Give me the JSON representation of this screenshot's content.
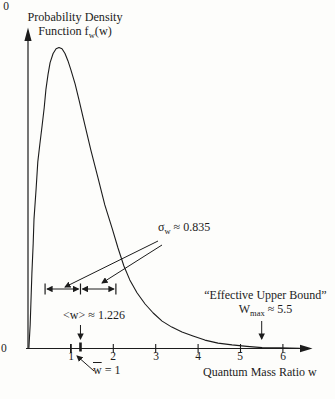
{
  "figure": {
    "ink": "#1c1c1c",
    "background": "#fdfdfb",
    "title_line1": "Probability Density",
    "title_line2_pre": "Function f",
    "title_line2_sub": "w",
    "title_line2_post": "(w)"
  },
  "axis": {
    "origin_zero": "0",
    "x_zero": "0",
    "x_title": "Quantum Mass Ratio w"
  },
  "annotations": {
    "sigma_pre": "σ",
    "sigma_sub": "w",
    "sigma_post": "≈ 0.835",
    "mean_label": "<w> ≈ 1.226",
    "upper_line1": "“Effective Upper Bound”",
    "upper_pre": "W",
    "upper_sub": "max",
    "upper_post": "≈ 5.5",
    "wbar_overbar": "w",
    "wbar_post": "= 1"
  },
  "chart_data": {
    "type": "line",
    "xlabel": "Quantum Mass Ratio w",
    "ylabel": "Probability Density f_w(w)",
    "xlim": [
      0,
      6.7
    ],
    "x_ticks": [
      1,
      2,
      3,
      4,
      5,
      6
    ],
    "grid": false,
    "legend": "none",
    "series": [
      {
        "name": "f_w(w)",
        "points": [
          [
            0.01,
            0.002
          ],
          [
            0.04,
            0.08
          ],
          [
            0.06,
            0.16
          ],
          [
            0.08,
            0.25
          ],
          [
            0.11,
            0.35
          ],
          [
            0.13,
            0.43
          ],
          [
            0.18,
            0.53
          ],
          [
            0.22,
            0.62
          ],
          [
            0.27,
            0.68
          ],
          [
            0.32,
            0.74
          ],
          [
            0.37,
            0.8
          ],
          [
            0.41,
            0.86
          ],
          [
            0.46,
            0.91
          ],
          [
            0.51,
            0.95
          ],
          [
            0.58,
            0.98
          ],
          [
            0.65,
            0.996
          ],
          [
            0.72,
            1.0
          ],
          [
            0.79,
            0.996
          ],
          [
            0.86,
            0.98
          ],
          [
            0.93,
            0.956
          ],
          [
            1.0,
            0.926
          ],
          [
            1.1,
            0.879
          ],
          [
            1.19,
            0.826
          ],
          [
            1.29,
            0.766
          ],
          [
            1.47,
            0.66
          ],
          [
            1.64,
            0.567
          ],
          [
            1.8,
            0.477
          ],
          [
            1.97,
            0.401
          ],
          [
            2.11,
            0.334
          ],
          [
            2.25,
            0.274
          ],
          [
            2.39,
            0.228
          ],
          [
            2.56,
            0.185
          ],
          [
            2.75,
            0.148
          ],
          [
            2.94,
            0.118
          ],
          [
            3.15,
            0.091
          ],
          [
            3.38,
            0.071
          ],
          [
            3.62,
            0.055
          ],
          [
            3.88,
            0.042
          ],
          [
            4.16,
            0.028
          ],
          [
            4.47,
            0.018
          ],
          [
            4.8,
            0.012
          ],
          [
            5.15,
            0.007
          ],
          [
            5.51,
            0.003
          ],
          [
            5.93,
            0.002
          ],
          [
            6.4,
            0.001
          ]
        ]
      }
    ],
    "annotations": {
      "mean_w": 1.226,
      "sigma_w": 0.835,
      "sigma_interval": [
        0.391,
        2.061
      ],
      "w_bar": 1,
      "w_max": 5.5,
      "sigma_label": "σ_w ≈ 0.835",
      "mean_label": "<w> ≈ 1.226",
      "upper_bound_label": "\"Effective Upper Bound\" W_max ≈ 5.5",
      "wbar_label": "w̄ = 1"
    }
  }
}
